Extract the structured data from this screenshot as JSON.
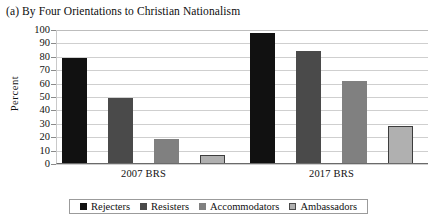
{
  "chart_data": {
    "type": "bar",
    "title": "(a) By Four Orientations to Christian Nationalism",
    "xlabel": "",
    "ylabel": "Percent",
    "ylim": [
      0,
      100
    ],
    "yticks": [
      0,
      10,
      20,
      30,
      40,
      50,
      60,
      70,
      80,
      90,
      100
    ],
    "grid": true,
    "legend_position": "bottom",
    "categories": [
      "2007 BRS",
      "2017 BRS"
    ],
    "series": [
      {
        "name": "Rejecters",
        "color": "#111111",
        "values": [
          79,
          98
        ]
      },
      {
        "name": "Resisters",
        "color": "#4a4a4a",
        "values": [
          49,
          84
        ]
      },
      {
        "name": "Accommodators",
        "color": "#808080",
        "values": [
          19,
          62
        ]
      },
      {
        "name": "Ambassadors",
        "color": "#b0b0b0",
        "values": [
          7,
          28
        ]
      }
    ]
  },
  "legend": {
    "items": [
      {
        "label": "Rejecters"
      },
      {
        "label": "Resisters"
      },
      {
        "label": "Accommodators"
      },
      {
        "label": "Ambassadors"
      }
    ]
  }
}
